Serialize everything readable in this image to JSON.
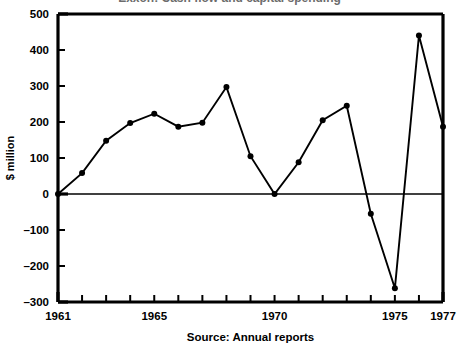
{
  "figure": {
    "title_remnant": "Exxon: Cash flow and capital spending",
    "caption": "Source: Annual reports",
    "axis_label_y": "$ million",
    "axis_label_x": ""
  },
  "chart_data": {
    "type": "line",
    "title": "",
    "xlabel": "",
    "ylabel": "$ million",
    "caption": "Source: Annual reports",
    "xlim": [
      1961,
      1977
    ],
    "ylim": [
      -300,
      500
    ],
    "grid": false,
    "legend": "none",
    "zero_line": true,
    "marker": "filled-circle",
    "y_ticks": [
      500,
      400,
      300,
      200,
      100,
      0,
      -100,
      -200,
      -300
    ],
    "y_tick_labels": [
      "500",
      "400",
      "300",
      "200",
      "100",
      "0",
      "–100",
      "–200",
      "–300"
    ],
    "x_ticks": [
      1961,
      1962,
      1963,
      1964,
      1965,
      1966,
      1967,
      1968,
      1969,
      1970,
      1971,
      1972,
      1973,
      1974,
      1975,
      1976,
      1977
    ],
    "x_tick_labels_shown": [
      "1961",
      "1965",
      "1970",
      "1975",
      "1977"
    ],
    "x": [
      1961,
      1962,
      1963,
      1964,
      1965,
      1966,
      1967,
      1968,
      1969,
      1970,
      1971,
      1972,
      1973,
      1974,
      1975,
      1976,
      1977
    ],
    "values": [
      0,
      58,
      148,
      197,
      223,
      187,
      198,
      297,
      105,
      0,
      88,
      205,
      245,
      -55,
      -262,
      440,
      187
    ]
  }
}
